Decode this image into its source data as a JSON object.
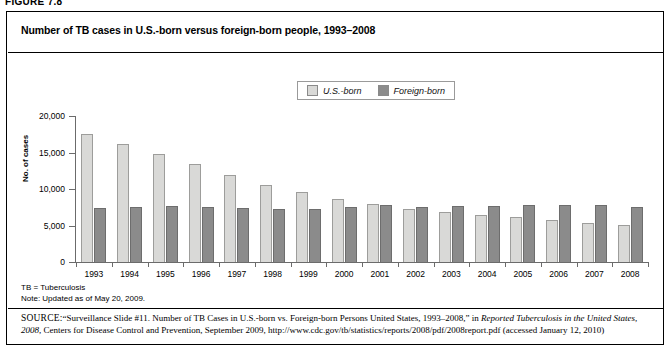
{
  "figure": {
    "number_label": "FIGURE 7.8",
    "title": "Number of TB cases in U.S.-born versus foreign-born people, 1993–2008"
  },
  "legend": {
    "position": "top-center",
    "items": [
      {
        "label": "U.S.-born",
        "color": "#d9d9d7",
        "swatch_name": "legend-swatch-us-born"
      },
      {
        "label": "Foreign-born",
        "color": "#8b8b8b",
        "swatch_name": "legend-swatch-foreign-born"
      }
    ]
  },
  "axes": {
    "y_title": "No. of cases",
    "y_ticks": [
      "20,000",
      "15,000",
      "10,000",
      "5,000",
      "0"
    ],
    "y_tick_values": [
      20000,
      15000,
      10000,
      5000,
      0
    ],
    "y_min": 0,
    "y_max": 20000,
    "grid": false
  },
  "notes": {
    "abbreviation": "TB = Tuberculosis",
    "update": "Note: Updated as of May 20, 2009."
  },
  "source": {
    "label": "SOURCE:",
    "text_1": "“Surveillance Slide #11. Number of TB Cases in U.S.-born vs. Foreign-born Persons United States, 1993–2008,” in ",
    "italic_1": "Reported Tuberculosis in the United States, 2008",
    "text_2": ", Centers for Disease Control and Prevention, September 2009, http://www.cdc.gov/tb/statistics/reports/2008/pdf/2008report.pdf (accessed January 12, 2010)"
  },
  "chart_data": {
    "type": "bar",
    "title": "Number of TB cases in U.S.-born versus foreign-born people, 1993–2008",
    "xlabel": "",
    "ylabel": "No. of cases",
    "ylim": [
      0,
      20000
    ],
    "grid": false,
    "legend_position": "top-center",
    "categories": [
      "1993",
      "1994",
      "1995",
      "1996",
      "1997",
      "1998",
      "1999",
      "2000",
      "2001",
      "2002",
      "2003",
      "2004",
      "2005",
      "2006",
      "2007",
      "2008"
    ],
    "series": [
      {
        "name": "U.S.-born",
        "color": "#d9d9d7",
        "values": [
          17500,
          16200,
          14800,
          13400,
          11900,
          10600,
          9600,
          8600,
          7900,
          7200,
          6900,
          6500,
          6200,
          5800,
          5300,
          5100
        ]
      },
      {
        "name": "Foreign-born",
        "color": "#8b8b8b",
        "values": [
          7400,
          7600,
          7700,
          7500,
          7400,
          7300,
          7300,
          7600,
          7800,
          7500,
          7700,
          7700,
          7800,
          7800,
          7800,
          7500
        ]
      }
    ]
  }
}
